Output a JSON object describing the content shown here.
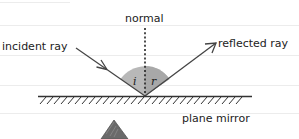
{
  "diagram": {
    "labels": {
      "normal": "normal",
      "incident_ray": "incident ray",
      "reflected_ray": "reflected ray",
      "plane_mirror": "plane mirror",
      "angle_incidence": "i",
      "angle_reflection": "r"
    },
    "colors": {
      "background": "#ffffff",
      "ruled_line": "#ececec",
      "ray": "#444444",
      "angle_fill": "#b8b8b8",
      "mirror": "#333333",
      "object": "#666666",
      "text": "#222222"
    }
  }
}
